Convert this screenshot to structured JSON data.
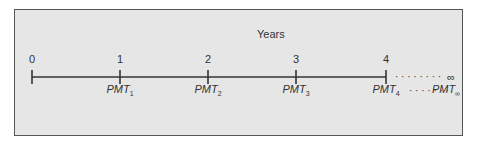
{
  "diagram": {
    "title": "Years",
    "periods": [
      {
        "label": "0",
        "x": 32,
        "payment": null,
        "payment_sub": null
      },
      {
        "label": "1",
        "x": 120,
        "payment": "PMT",
        "payment_sub": "1"
      },
      {
        "label": "2",
        "x": 208,
        "payment": "PMT",
        "payment_sub": "2"
      },
      {
        "label": "3",
        "x": 296,
        "payment": "PMT",
        "payment_sub": "3"
      },
      {
        "label": "4",
        "x": 386,
        "payment": "PMT",
        "payment_sub": "4"
      }
    ],
    "infinity_label": "∞",
    "infinity_payment": "PMT",
    "infinity_payment_sub": "∞",
    "dots_upper": "· · · · · · · ·",
    "dots_lower": "· · · · · · ·",
    "colors": {
      "background": "#e6e6e6",
      "border": "#555555",
      "line": "#333333",
      "text": "#333333"
    }
  }
}
